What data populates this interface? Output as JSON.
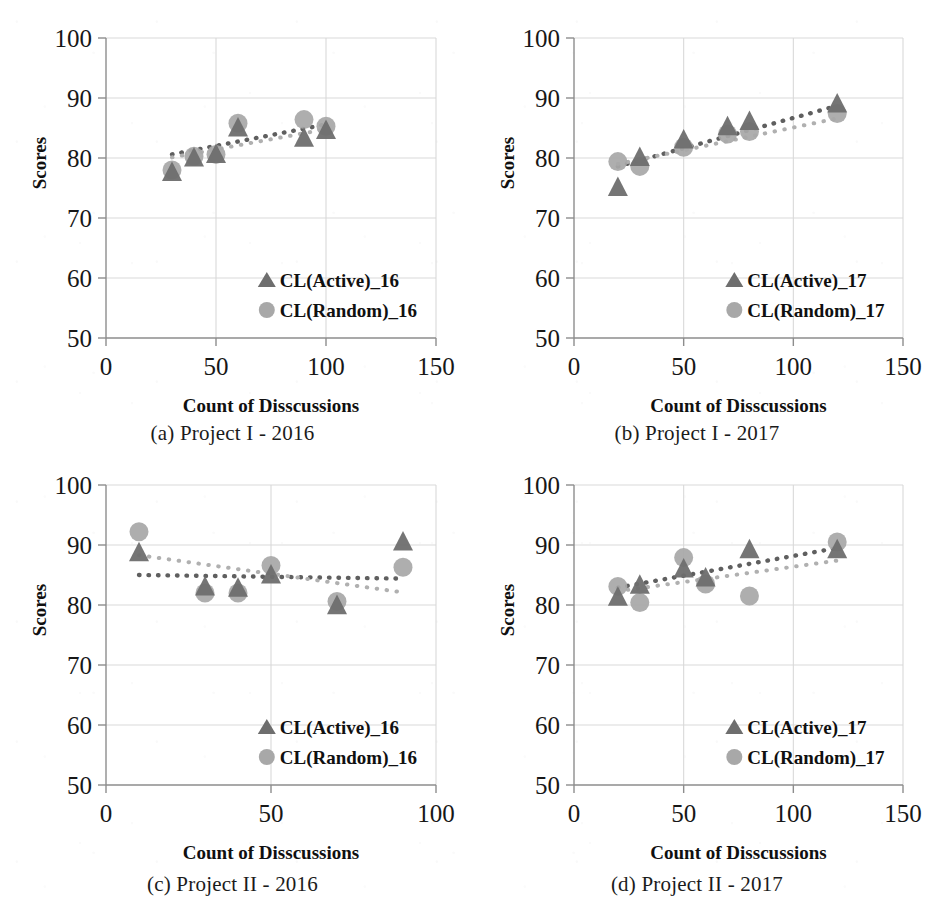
{
  "figure": {
    "background_color": "#ffffff",
    "series_colors": {
      "active": "#6e6e6e",
      "random": "#a8a8a8",
      "trend_active": "#5f5f5f",
      "trend_random": "#b0b0b0",
      "axis": "#8d8d8d",
      "grid": "#d9d9d9",
      "text": "#171717"
    }
  },
  "panels": [
    {
      "key": "a",
      "caption": "(a) Project I - 2016",
      "chart_data": {
        "type": "scatter",
        "title": "(a) Project I - 2016",
        "xlabel": "Count of Disscussions",
        "ylabel": "Scores",
        "xlim": [
          0,
          150
        ],
        "ylim": [
          50,
          100
        ],
        "xticks": [
          0,
          50,
          100,
          150
        ],
        "yticks": [
          50,
          60,
          70,
          80,
          90,
          100
        ],
        "grid": true,
        "legend_position": "center-right-inside",
        "series": [
          {
            "name": "CL(Active)_16",
            "marker": "triangle",
            "color": "#6e6e6e",
            "x": [
              30,
              40,
              50,
              60,
              90,
              100
            ],
            "y": [
              77.6,
              80.0,
              80.6,
              85.0,
              83.3,
              84.6
            ],
            "trendline": {
              "style": "dotted",
              "x": [
                30,
                100
              ],
              "y": [
                80.6,
                85.6
              ]
            }
          },
          {
            "name": "CL(Random)_16",
            "marker": "circle",
            "color": "#a8a8a8",
            "x": [
              30,
              40,
              50,
              60,
              90,
              100
            ],
            "y": [
              78.0,
              80.3,
              80.6,
              85.8,
              86.4,
              85.3
            ],
            "trendline": {
              "style": "dotted",
              "x": [
                30,
                100
              ],
              "y": [
                80.1,
                84.8
              ]
            }
          }
        ]
      }
    },
    {
      "key": "b",
      "caption": "(b) Project I - 2017",
      "chart_data": {
        "type": "scatter",
        "title": "(b) Project I - 2017",
        "xlabel": "Count of Disscussions",
        "ylabel": "Scores",
        "xlim": [
          0,
          150
        ],
        "ylim": [
          50,
          100
        ],
        "xticks": [
          0,
          50,
          100,
          150
        ],
        "yticks": [
          50,
          60,
          70,
          80,
          90,
          100
        ],
        "grid": true,
        "legend_position": "center-right-inside",
        "series": [
          {
            "name": "CL(Active)_17",
            "marker": "triangle",
            "color": "#6e6e6e",
            "x": [
              20,
              30,
              50,
              70,
              80,
              120
            ],
            "y": [
              75.1,
              80.1,
              83.0,
              85.2,
              86.1,
              89.0
            ],
            "trendline": {
              "style": "dotted",
              "x": [
                20,
                120
              ],
              "y": [
                78.6,
                88.7
              ]
            }
          },
          {
            "name": "CL(Random)_17",
            "marker": "circle",
            "color": "#a8a8a8",
            "x": [
              20,
              30,
              50,
              70,
              80,
              120
            ],
            "y": [
              79.4,
              78.6,
              81.8,
              84.0,
              84.4,
              87.4
            ],
            "trendline": {
              "style": "dotted",
              "x": [
                20,
                120
              ],
              "y": [
                79.0,
                86.6
              ]
            }
          }
        ]
      }
    },
    {
      "key": "c",
      "caption": "(c) Project II - 2016",
      "chart_data": {
        "type": "scatter",
        "title": "(c) Project II - 2016",
        "xlabel": "Count of Disscussions",
        "ylabel": "Scores",
        "xlim": [
          0,
          100
        ],
        "ylim": [
          50,
          100
        ],
        "xticks": [
          0,
          50,
          100
        ],
        "yticks": [
          50,
          60,
          70,
          80,
          90,
          100
        ],
        "grid": true,
        "legend_position": "center-right-inside",
        "series": [
          {
            "name": "CL(Active)_16",
            "marker": "triangle",
            "color": "#6e6e6e",
            "x": [
              10,
              30,
              40,
              50,
              70,
              90
            ],
            "y": [
              88.7,
              83.0,
              82.8,
              85.0,
              79.9,
              90.5
            ],
            "trendline": {
              "style": "dotted",
              "x": [
                10,
                90
              ],
              "y": [
                85.0,
                84.4
              ]
            }
          },
          {
            "name": "CL(Random)_16",
            "marker": "circle",
            "color": "#a8a8a8",
            "x": [
              10,
              30,
              40,
              50,
              70,
              90
            ],
            "y": [
              92.2,
              82.0,
              82.0,
              86.6,
              80.6,
              86.3
            ],
            "trendline": {
              "style": "dotted",
              "x": [
                10,
                90
              ],
              "y": [
                88.3,
                82.1
              ]
            }
          }
        ]
      }
    },
    {
      "key": "d",
      "caption": "(d) Project II - 2017",
      "chart_data": {
        "type": "scatter",
        "title": "(d) Project II - 2017",
        "xlabel": "Count of Disscussions",
        "ylabel": "Scores",
        "xlim": [
          0,
          150
        ],
        "ylim": [
          50,
          100
        ],
        "xticks": [
          0,
          50,
          100,
          150
        ],
        "yticks": [
          50,
          60,
          70,
          80,
          90,
          100
        ],
        "grid": true,
        "legend_position": "center-right-inside",
        "series": [
          {
            "name": "CL(Active)_17",
            "marker": "triangle",
            "color": "#6e6e6e",
            "x": [
              20,
              30,
              50,
              60,
              80,
              120
            ],
            "y": [
              81.3,
              83.3,
              86.0,
              84.5,
              89.2,
              89.2
            ],
            "trendline": {
              "style": "dotted",
              "x": [
                20,
                120
              ],
              "y": [
                82.9,
                89.5
              ]
            }
          },
          {
            "name": "CL(Random)_17",
            "marker": "circle",
            "color": "#a8a8a8",
            "x": [
              20,
              30,
              50,
              60,
              80,
              120
            ],
            "y": [
              83.1,
              80.4,
              87.9,
              83.5,
              81.5,
              90.5
            ],
            "trendline": {
              "style": "dotted",
              "x": [
                20,
                120
              ],
              "y": [
                82.3,
                87.4
              ]
            }
          }
        ]
      }
    }
  ]
}
